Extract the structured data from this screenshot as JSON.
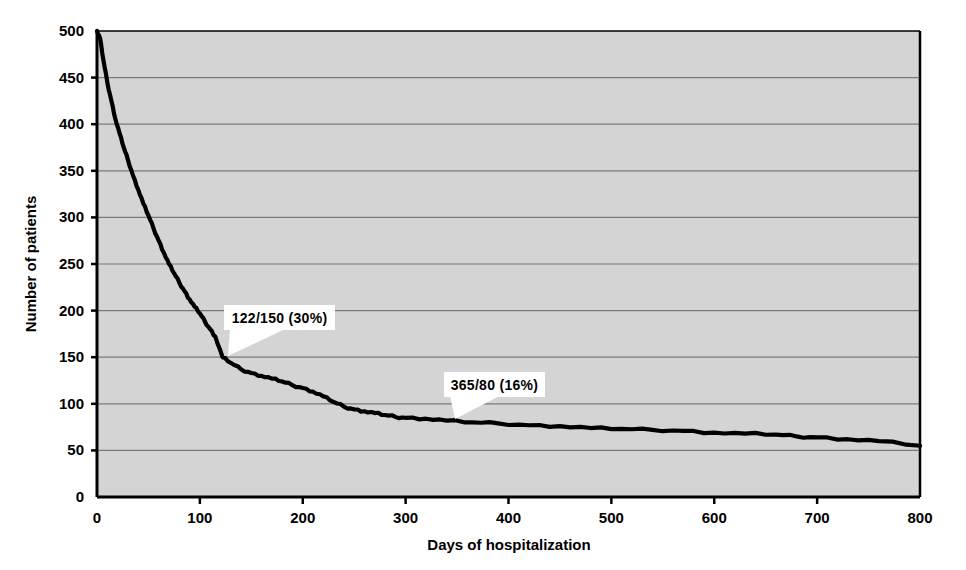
{
  "chart_data": {
    "type": "line",
    "title": "",
    "subtitle": "",
    "xlabel": "Days of hospitalization",
    "ylabel": "Number of patients",
    "xlim": [
      0,
      800
    ],
    "ylim": [
      0,
      500
    ],
    "xticks": [
      0,
      100,
      200,
      300,
      400,
      500,
      600,
      700,
      800
    ],
    "yticks": [
      0,
      50,
      100,
      150,
      200,
      250,
      300,
      350,
      400,
      450,
      500
    ],
    "xtick_labels": [
      "0",
      "100",
      "200",
      "300",
      "400",
      "500",
      "600",
      "700",
      "800"
    ],
    "ytick_labels": [
      "0",
      "50",
      "100",
      "150",
      "200",
      "250",
      "300",
      "350",
      "400",
      "450",
      "500"
    ],
    "grid": "horizontal",
    "legend": "none",
    "plot_background": "#d4d4d4",
    "grid_color": "#7a7a7a",
    "line_color": "#000000",
    "axis_color": "#000000",
    "series": [
      {
        "name": "Patients remaining hospitalized",
        "x": [
          0,
          3,
          6,
          10,
          14,
          18,
          22,
          26,
          30,
          35,
          40,
          45,
          50,
          55,
          60,
          65,
          70,
          75,
          80,
          85,
          90,
          95,
          100,
          105,
          110,
          115,
          122,
          130,
          140,
          150,
          160,
          170,
          180,
          190,
          200,
          210,
          220,
          230,
          240,
          250,
          260,
          270,
          280,
          290,
          300,
          320,
          340,
          365,
          390,
          420,
          450,
          480,
          510,
          540,
          570,
          600,
          630,
          660,
          680,
          700,
          730,
          760,
          800
        ],
        "y": [
          500,
          492,
          470,
          445,
          425,
          405,
          390,
          375,
          362,
          345,
          330,
          315,
          302,
          288,
          275,
          262,
          250,
          240,
          230,
          221,
          212,
          204,
          197,
          188,
          180,
          172,
          150,
          144,
          137,
          133,
          130,
          127,
          124,
          120,
          117,
          113,
          108,
          102,
          97,
          94,
          92,
          90,
          88,
          86,
          85,
          84,
          82,
          80,
          79,
          77,
          76,
          74,
          73,
          72,
          71,
          69,
          68,
          67,
          65,
          64,
          62,
          60,
          55
        ]
      }
    ],
    "annotations": [
      {
        "text": "122/150 (30%)",
        "point_x": 122,
        "point_y": 150,
        "label_x": 224,
        "label_y": 305,
        "label_w": 111,
        "label_h": 25,
        "tip_x": 228,
        "tip_y": 356
      },
      {
        "text": "365/80 (16%)",
        "point_x": 365,
        "point_y": 80,
        "label_x": 444,
        "label_y": 372,
        "label_w": 101,
        "label_h": 25,
        "tip_x": 455,
        "tip_y": 419
      }
    ]
  }
}
